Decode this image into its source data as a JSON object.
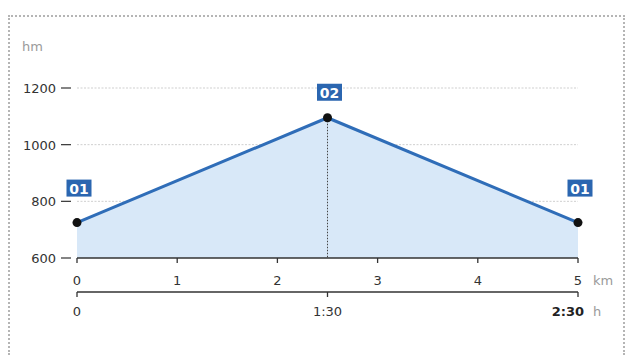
{
  "chart_data": {
    "type": "area",
    "title": "",
    "ylabel": "hm",
    "xlabel": "km",
    "x2label": "h",
    "ylim": [
      600,
      1200
    ],
    "xlim": [
      0,
      5
    ],
    "grid": true,
    "legend": null,
    "y_ticks": [
      {
        "value": 1200,
        "label": "1200"
      },
      {
        "value": 1000,
        "label": "1000"
      },
      {
        "value": 800,
        "label": "800"
      },
      {
        "value": 600,
        "label": "600"
      }
    ],
    "x_ticks": [
      {
        "value": 0,
        "label": "0"
      },
      {
        "value": 1,
        "label": "1"
      },
      {
        "value": 2,
        "label": "2"
      },
      {
        "value": 3,
        "label": "3"
      },
      {
        "value": 4,
        "label": "4"
      },
      {
        "value": 5,
        "label": "5"
      }
    ],
    "time_ticks": [
      {
        "km": 0,
        "label": "0",
        "bold": false
      },
      {
        "km": 2.5,
        "label": "1:30",
        "bold": false
      },
      {
        "km": 5,
        "label": "2:30",
        "bold": true
      }
    ],
    "series": [
      {
        "name": "elevation profile",
        "x": [
          0,
          2.5,
          5
        ],
        "y": [
          725,
          1095,
          725
        ]
      }
    ],
    "waypoints": [
      {
        "label": "01",
        "km": 0,
        "elevation": 725
      },
      {
        "label": "02",
        "km": 2.5,
        "elevation": 1095
      },
      {
        "label": "01",
        "km": 5,
        "elevation": 725
      }
    ],
    "colors": {
      "line": "#2f6db8",
      "fill": "#d8e8f8",
      "badge": "#2b66b0",
      "point": "#111111",
      "grid": "#cfcfcf",
      "axis": "#333333"
    }
  }
}
